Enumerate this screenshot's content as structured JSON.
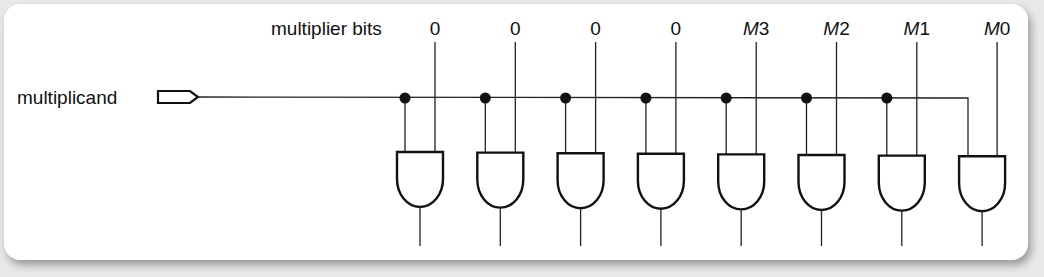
{
  "diagram": {
    "title_label": "multiplier bits",
    "input_label": "multiplicand",
    "bit_labels": [
      {
        "prefix": "",
        "num": "0"
      },
      {
        "prefix": "",
        "num": "0"
      },
      {
        "prefix": "",
        "num": "0"
      },
      {
        "prefix": "",
        "num": "0"
      },
      {
        "prefix": "M",
        "num": "3"
      },
      {
        "prefix": "M",
        "num": "2"
      },
      {
        "prefix": "M",
        "num": "1"
      },
      {
        "prefix": "M",
        "num": "0"
      }
    ],
    "gate_type": "AND",
    "gate_count": 8,
    "colors": {
      "line": "#222222",
      "background": "#ffffff",
      "page": "#e9e9e9"
    }
  }
}
